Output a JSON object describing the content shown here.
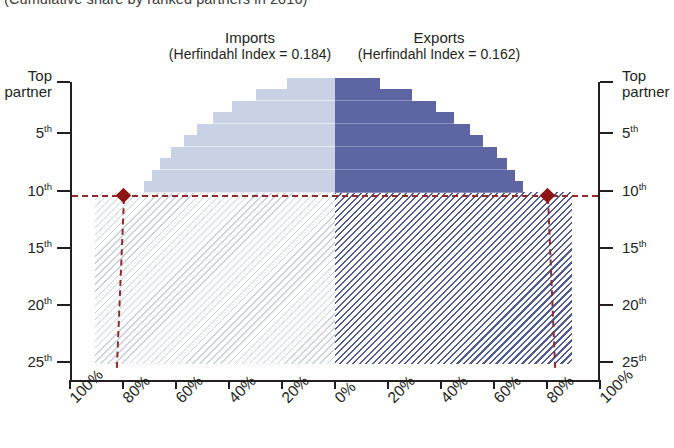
{
  "chart_subtitle": "(Cumulative share by ranked partners in 2016)",
  "panels": {
    "imports": {
      "title": "Imports",
      "index_label": "(Herfindahl Index = 0.184)",
      "herfindahl_index": 0.184,
      "color": "#c9d2e4"
    },
    "exports": {
      "title": "Exports",
      "index_label": "(Herfindahl Index = 0.162)",
      "herfindahl_index": 0.162,
      "color": "#5d65a2"
    }
  },
  "axes": {
    "y_left_labels": [
      "Top\npartner",
      "5th",
      "10th",
      "15th",
      "20th",
      "25th"
    ],
    "y_right_labels": [
      "Top\npartner",
      "5th",
      "10th",
      "15th",
      "20th",
      "25th"
    ],
    "y_top_label_line1": "Top",
    "y_top_label_line2": "partner",
    "y_ranks": [
      "5",
      "10",
      "15",
      "20",
      "25"
    ],
    "y_suffix": "th",
    "x_labels_left": [
      "100%",
      "80%",
      "60%",
      "40%",
      "20%",
      "0%"
    ],
    "x_labels_right": [
      "20%",
      "40%",
      "60%",
      "80%",
      "100%"
    ],
    "x_min": 0,
    "x_max": 100,
    "x_unit": "%"
  },
  "reference": {
    "rank": 10,
    "line_color": "#8e2b2b",
    "marker_color": "#8e1616",
    "imports_share_at_rank": 80,
    "exports_share_at_rank": 80
  },
  "chart_data": {
    "type": "area",
    "subtitle": "(Cumulative share by ranked partners in 2016)",
    "xlabel": "",
    "ylabel": "Partner rank",
    "xlim": [
      0,
      100
    ],
    "ylim": [
      1,
      25
    ],
    "grid": false,
    "legend": "none",
    "orientation": "mirrored-horizontal",
    "categories": [
      "1",
      "2",
      "3",
      "4",
      "5",
      "6",
      "7",
      "8",
      "9",
      "10",
      "11",
      "12",
      "13",
      "14",
      "15",
      "16",
      "17",
      "18",
      "19",
      "20",
      "21",
      "22",
      "23",
      "24",
      "25"
    ],
    "series": [
      {
        "name": "Imports",
        "axis": "left",
        "color": "#c9d2e4",
        "herfindahl_index": 0.184,
        "values": [
          18,
          30,
          39,
          46,
          52,
          57,
          62,
          66,
          69,
          72,
          74,
          76,
          78,
          80,
          81.5,
          83,
          84,
          85,
          86,
          87,
          88,
          88.8,
          89.5,
          90,
          90.5
        ]
      },
      {
        "name": "Exports",
        "axis": "right",
        "color": "#5d65a2",
        "herfindahl_index": 0.162,
        "values": [
          17,
          29,
          38,
          45,
          51,
          56,
          61,
          65,
          68,
          71,
          73,
          75,
          77,
          79,
          80.5,
          82,
          83,
          84,
          85,
          86,
          87,
          87.8,
          88.5,
          89,
          89.5
        ]
      }
    ],
    "annotations": [
      {
        "label": "10th partner reference",
        "rank": 10,
        "imports_value": 80,
        "exports_value": 80,
        "style": "dashed",
        "color": "#8e2b2b"
      }
    ]
  }
}
